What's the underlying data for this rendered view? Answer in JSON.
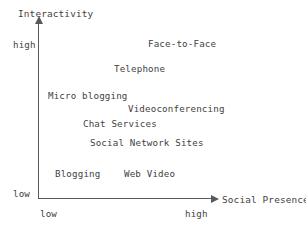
{
  "chart_data": {
    "type": "scatter",
    "title": "",
    "xlabel": "Social Presence",
    "ylabel": "Interactivity",
    "xlim": [
      "low",
      "high"
    ],
    "ylim": [
      "low",
      "high"
    ],
    "grid": false,
    "legend": "none",
    "x_ticks": [
      "low",
      "high"
    ],
    "y_ticks": [
      "low",
      "high"
    ],
    "note": "Conceptual positioning map; points are rendered as text labels only (no markers).",
    "points": [
      {
        "label": "Face-to-Face",
        "x": "high",
        "y": "high",
        "px": 148,
        "py": 39
      },
      {
        "label": "Telephone",
        "x": "medium-high",
        "y": "high",
        "px": 114,
        "py": 64
      },
      {
        "label": "Micro blogging",
        "x": "low-medium",
        "y": "medium-high",
        "px": 48,
        "py": 91
      },
      {
        "label": "Videoconferencing",
        "x": "high",
        "y": "medium",
        "px": 128,
        "py": 104
      },
      {
        "label": "Chat Services",
        "x": "medium",
        "y": "medium",
        "px": 83,
        "py": 119
      },
      {
        "label": "Social Network Sites",
        "x": "medium",
        "y": "low-medium",
        "px": 90,
        "py": 138
      },
      {
        "label": "Blogging",
        "x": "low",
        "y": "low",
        "px": 55,
        "py": 169
      },
      {
        "label": "Web Video",
        "x": "medium",
        "y": "low",
        "px": 124,
        "py": 169
      }
    ]
  },
  "axes": {
    "y_title": "Interactivity",
    "x_title": "Social Presence",
    "y_tick_high": "high",
    "y_tick_low": "low",
    "x_tick_low": "low",
    "x_tick_high": "high"
  },
  "colors": {
    "background": "#ffffff",
    "axis": "#595959",
    "text": "#3f3f3f"
  }
}
